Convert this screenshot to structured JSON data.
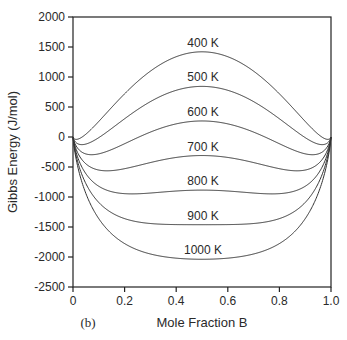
{
  "chart_data": {
    "type": "line",
    "title": "",
    "panel_label": "(b)",
    "xlabel": "Mole Fraction B",
    "ylabel": "Gibbs Energy (J/mol)",
    "xlim": [
      0,
      1.0
    ],
    "ylim": [
      -2500,
      2000
    ],
    "xticks": [
      0,
      0.2,
      0.4,
      0.6,
      0.8,
      1.0
    ],
    "xtick_labels": [
      "0",
      "0.2",
      "0.4",
      "0.6",
      "0.8",
      "1.0"
    ],
    "yticks": [
      2000,
      1500,
      1000,
      500,
      0,
      -500,
      -1000,
      -1500,
      -2000,
      -2500
    ],
    "ytick_labels": [
      "2000",
      "1500",
      "1000",
      "500",
      "0",
      "-500",
      "-1000",
      "-1500",
      "-2000",
      "-2500"
    ],
    "grid": false,
    "model": "G = W*x*(1-x) + R*T*(x ln x + (1-x) ln(1-x))",
    "W": 14900,
    "R": 8.314,
    "series": [
      {
        "name": "400 K",
        "T": 400,
        "G_at_0.5": 1420
      },
      {
        "name": "500 K",
        "T": 500,
        "G_at_0.5": 840
      },
      {
        "name": "600 K",
        "T": 600,
        "G_at_0.5": 270
      },
      {
        "name": "700 K",
        "T": 700,
        "G_at_0.5": -310
      },
      {
        "name": "800 K",
        "T": 800,
        "G_at_0.5": -880
      },
      {
        "name": "900 K",
        "T": 900,
        "G_at_0.5": -1460
      },
      {
        "name": "1000 K",
        "T": 1000,
        "G_at_0.5": -2040
      }
    ]
  }
}
